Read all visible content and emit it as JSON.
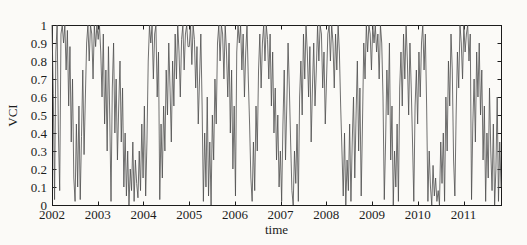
{
  "figure": {
    "xlabel": "time",
    "ylabel": "VCI"
  },
  "chart_data": {
    "type": "line",
    "title": "",
    "xlabel": "time",
    "ylabel": "VCI",
    "xlim": [
      2002,
      2011.82
    ],
    "ylim": [
      0,
      1
    ],
    "grid": false,
    "legend": "none",
    "box": true,
    "x_ticks": [
      2002,
      2003,
      2004,
      2005,
      2006,
      2007,
      2008,
      2009,
      2010,
      2011
    ],
    "x_tick_labels": [
      "2002",
      "2003",
      "2004",
      "2005",
      "2006",
      "2007",
      "2008",
      "2009",
      "2010",
      "2011"
    ],
    "y_ticks": [
      0,
      0.1,
      0.2,
      0.3,
      0.4,
      0.5,
      0.6,
      0.7,
      0.8,
      0.9,
      1
    ],
    "y_tick_labels": [
      "0",
      "0.1",
      "0.2",
      "0.3",
      "0.4",
      "0.5",
      "0.6",
      "0.7",
      "0.8",
      "0.9",
      "1"
    ],
    "colors": {
      "line": "#4d4d4d",
      "axis": "#1c1c1c",
      "background": "#fbfaf7"
    },
    "series": [
      {
        "name": "VCI",
        "x_start": 2002,
        "x_step": 0.02806,
        "values": [
          1.0,
          0.62,
          0.03,
          0.85,
          1.0,
          0.4,
          0.08,
          0.95,
          1.0,
          0.9,
          1.0,
          0.75,
          0.97,
          0.55,
          0.88,
          0.35,
          0.7,
          0.15,
          0.02,
          0.45,
          0.1,
          0.55,
          0.03,
          0.38,
          0.75,
          0.28,
          0.6,
          0.9,
          1.0,
          0.8,
          1.0,
          0.95,
          0.7,
          1.0,
          0.88,
          1.0,
          0.92,
          1.0,
          0.85,
          0.6,
          0.95,
          0.45,
          0.75,
          0.3,
          0.88,
          0.5,
          0.02,
          0.65,
          0.9,
          0.4,
          0.7,
          0.25,
          0.55,
          0.8,
          0.35,
          0.65,
          0.1,
          0.4,
          0.05,
          0.3,
          0.0,
          0.2,
          0.08,
          0.35,
          0.02,
          0.25,
          0.12,
          0.04,
          0.3,
          0.08,
          0.45,
          0.15,
          0.55,
          0.05,
          0.35,
          0.8,
          1.0,
          0.9,
          1.0,
          0.7,
          0.95,
          1.0,
          0.6,
          0.85,
          0.03,
          0.45,
          0.15,
          0.55,
          0.3,
          0.75,
          0.5,
          0.9,
          0.65,
          0.35,
          0.8,
          0.55,
          0.95,
          0.7,
          1.0,
          0.85,
          0.6,
          0.92,
          1.0,
          0.75,
          0.95,
          1.0,
          0.88,
          0.88,
          1.0,
          0.78,
          1.0,
          0.92,
          0.65,
          0.88,
          0.45,
          0.7,
          0.95,
          0.55,
          0.02,
          0.4,
          0.1,
          0.6,
          0.05,
          0.35,
          0.0,
          0.5,
          0.25,
          0.7,
          0.45,
          0.9,
          1.0,
          0.8,
          1.0,
          0.95,
          0.7,
          1.0,
          0.85,
          0.6,
          0.9,
          0.4,
          0.75,
          0.2,
          0.55,
          0.05,
          0.85,
          1.0,
          0.9,
          1.0,
          0.75,
          0.95,
          0.6,
          0.85,
          1.0,
          0.7,
          0.45,
          0.15,
          0.02,
          0.35,
          0.08,
          0.55,
          0.3,
          0.75,
          0.95,
          0.65,
          0.9,
          1.0,
          0.8,
          1.0,
          0.92,
          0.7,
          0.95,
          0.55,
          0.85,
          0.4,
          0.65,
          0.25,
          0.5,
          0.1,
          0.3,
          0.02,
          0.45,
          0.75,
          0.25,
          0.55,
          0.9,
          0.65,
          0.35,
          0.08,
          0.0,
          0.3,
          0.12,
          0.45,
          0.02,
          0.6,
          0.8,
          0.5,
          0.95,
          0.7,
          1.0,
          0.85,
          0.6,
          0.88,
          0.35,
          0.65,
          0.9,
          0.55,
          0.75,
          1.0,
          0.8,
          1.0,
          0.95,
          0.65,
          0.85,
          0.45,
          0.7,
          0.95,
          1.0,
          0.8,
          1.0,
          0.9,
          0.65,
          0.95,
          0.75,
          1.0,
          0.85,
          0.55,
          0.3,
          0.05,
          0.4,
          0.0,
          0.25,
          0.08,
          0.45,
          0.02,
          0.35,
          0.6,
          0.15,
          0.5,
          0.8,
          0.3,
          0.65,
          0.05,
          0.45,
          0.9,
          0.7,
          1.0,
          0.85,
          1.0,
          0.95,
          0.75,
          1.0,
          0.9,
          1.0,
          0.85,
          0.95,
          0.7,
          1.0,
          0.9,
          0.6,
          0.03,
          0.35,
          0.75,
          0.5,
          0.9,
          0.25,
          0.55,
          0.0,
          0.3,
          0.1,
          0.45,
          0.02,
          0.65,
          0.85,
          0.55,
          0.95,
          0.7,
          1.0,
          0.8,
          0.5,
          0.9,
          0.65,
          0.35,
          0.02,
          0.55,
          0.75,
          0.45,
          0.85,
          0.6,
          0.9,
          1.0,
          0.75,
          0.95,
          0.55,
          0.02,
          0.3,
          0.1,
          0.0,
          0.22,
          0.05,
          0.15,
          0.02,
          0.08,
          0.0,
          0.35,
          0.12,
          0.4,
          0.02,
          0.6,
          0.3,
          0.8,
          0.55,
          0.95,
          0.75,
          0.25,
          0.05,
          0.5,
          0.85,
          0.65,
          1.0,
          0.9,
          0.7,
          1.0,
          0.85,
          0.95,
          1.0,
          0.8,
          0.95,
          0.03,
          0.45,
          0.7,
          0.35,
          0.85,
          0.6,
          0.9,
          0.5,
          0.75,
          0.25,
          0.55,
          0.02,
          0.4,
          0.15,
          0.65,
          0.3,
          0.08,
          0.45,
          0.0,
          0.2,
          0.6,
          0.02,
          0.35,
          0.1
        ]
      }
    ]
  }
}
